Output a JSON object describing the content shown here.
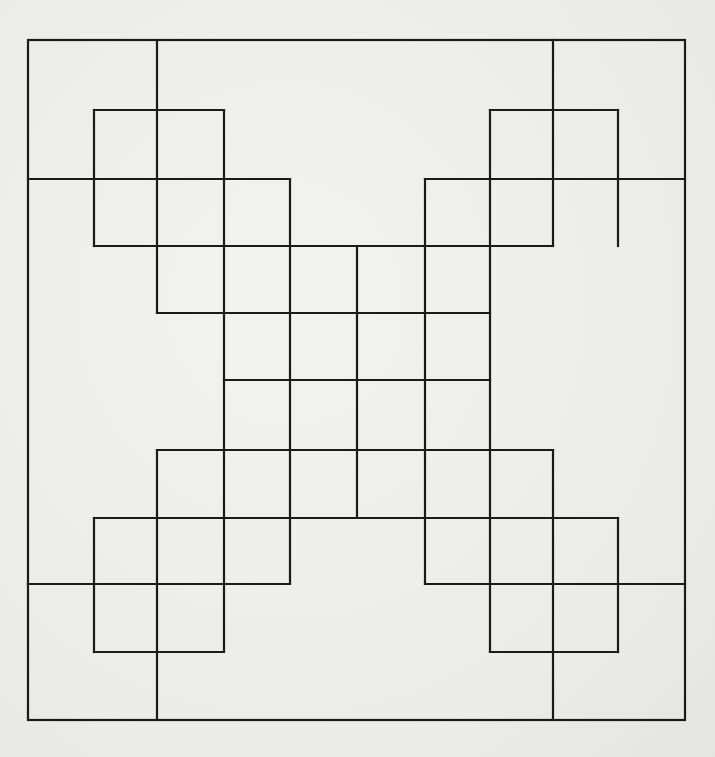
{
  "diagram": {
    "title": "",
    "stroke_color": "#1a1a1a",
    "background_color": "#ededeb",
    "columns_x": [
      28,
      94,
      157,
      224,
      290,
      357,
      425,
      490,
      553,
      618,
      685
    ],
    "rows_y": [
      40,
      110,
      179,
      246,
      313,
      380,
      450,
      518,
      584,
      652,
      720
    ],
    "frame": {
      "c0": 0,
      "r0": 0,
      "c1": 10,
      "r1": 10
    },
    "segments": [
      {
        "type": "h",
        "row": 2,
        "from": 0,
        "to": 4
      },
      {
        "type": "v",
        "col": 2,
        "from": 0,
        "to": 4
      },
      {
        "type": "h",
        "row": 1,
        "from": 1,
        "to": 3
      },
      {
        "type": "v",
        "col": 1,
        "from": 1,
        "to": 3
      },
      {
        "type": "v",
        "col": 3,
        "from": 1,
        "to": 9
      },
      {
        "type": "h",
        "row": 3,
        "from": 1,
        "to": 8
      },
      {
        "type": "h",
        "row": 4,
        "from": 2,
        "to": 7
      },
      {
        "type": "v",
        "col": 4,
        "from": 2,
        "to": 8
      },
      {
        "type": "h",
        "row": 2,
        "from": 6,
        "to": 10
      },
      {
        "type": "v",
        "col": 8,
        "from": 0,
        "to": 3
      },
      {
        "type": "h",
        "row": 1,
        "from": 7,
        "to": 9
      },
      {
        "type": "v",
        "col": 9,
        "from": 1,
        "to": 3
      },
      {
        "type": "v",
        "col": 7,
        "from": 1,
        "to": 9
      },
      {
        "type": "v",
        "col": 6,
        "from": 2,
        "to": 8
      },
      {
        "type": "v",
        "col": 5,
        "from": 3,
        "to": 7
      },
      {
        "type": "h",
        "row": 5,
        "from": 3,
        "to": 7
      },
      {
        "type": "h",
        "row": 6,
        "from": 2,
        "to": 8
      },
      {
        "type": "v",
        "col": 2,
        "from": 6,
        "to": 10
      },
      {
        "type": "h",
        "row": 7,
        "from": 1,
        "to": 9
      },
      {
        "type": "v",
        "col": 1,
        "from": 7,
        "to": 9
      },
      {
        "type": "h",
        "row": 9,
        "from": 1,
        "to": 3
      },
      {
        "type": "h",
        "row": 8,
        "from": 0,
        "to": 4
      },
      {
        "type": "v",
        "col": 8,
        "from": 6,
        "to": 10
      },
      {
        "type": "v",
        "col": 9,
        "from": 7,
        "to": 9
      },
      {
        "type": "h",
        "row": 9,
        "from": 7,
        "to": 9
      },
      {
        "type": "h",
        "row": 8,
        "from": 6,
        "to": 10
      }
    ]
  }
}
